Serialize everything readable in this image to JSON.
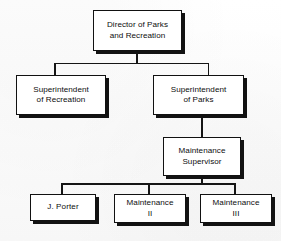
{
  "chart": {
    "type": "org-chart",
    "background_color": "#fdfdfd",
    "line_color": "#151515",
    "box_fill": "#ffffff",
    "box_border_color": "#111111",
    "shadow_color": "#121212",
    "nodes": [
      {
        "id": "director",
        "label": "Director of Parks\nand Recreation",
        "level": 0,
        "x": 93,
        "y": 10,
        "width": 89,
        "height": 41
      },
      {
        "id": "supt-recreation",
        "label": "Superintendent\nof Recreation",
        "level": 1,
        "x": 16,
        "y": 75,
        "width": 90,
        "height": 40
      },
      {
        "id": "supt-parks",
        "label": "Superintendent\nof Parks",
        "level": 1,
        "x": 153,
        "y": 75,
        "width": 91,
        "height": 40
      },
      {
        "id": "maintenance-supervisor",
        "label": "Maintenance\nSupervisor",
        "level": 2,
        "x": 163,
        "y": 137,
        "width": 78,
        "height": 39
      },
      {
        "id": "j-porter",
        "label": "J. Porter",
        "level": 3,
        "x": 30,
        "y": 194,
        "width": 66,
        "height": 27
      },
      {
        "id": "maintenance-ii",
        "label": "Maintenance\nII",
        "level": 3,
        "x": 114,
        "y": 194,
        "width": 72,
        "height": 29
      },
      {
        "id": "maintenance-iii",
        "label": "Maintenance\nIII",
        "level": 3,
        "x": 200,
        "y": 194,
        "width": 72,
        "height": 29
      }
    ],
    "edges": [
      {
        "from": "director",
        "to": "supt-recreation"
      },
      {
        "from": "director",
        "to": "supt-parks"
      },
      {
        "from": "supt-parks",
        "to": "maintenance-supervisor"
      },
      {
        "from": "maintenance-supervisor",
        "to": "j-porter"
      },
      {
        "from": "maintenance-supervisor",
        "to": "maintenance-ii"
      },
      {
        "from": "maintenance-supervisor",
        "to": "maintenance-iii"
      }
    ]
  }
}
